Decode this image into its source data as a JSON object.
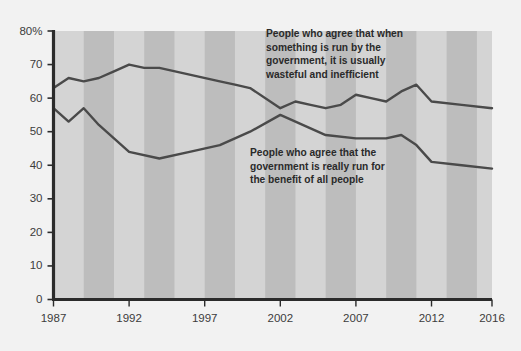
{
  "chart_data": {
    "type": "line",
    "title": "",
    "subtitle": "",
    "xlabel": "",
    "ylabel": "",
    "xlim": [
      1987,
      2016
    ],
    "ylim": [
      0,
      80
    ],
    "grid": false,
    "legend_position": "inline-annotations",
    "background": {
      "plot_fill": "#d4d4d4",
      "stripe_fill": "#bdbdbd",
      "page_fill": "#f2f2f2",
      "axis_color": "#2b2b2b",
      "line_color": "#4a4a4a"
    },
    "y_ticks": [
      "0",
      "10",
      "20",
      "30",
      "40",
      "50",
      "60",
      "70",
      "80%"
    ],
    "y_tick_values": [
      0,
      10,
      20,
      30,
      40,
      50,
      60,
      70,
      80
    ],
    "x_ticks": [
      "1987",
      "1992",
      "1997",
      "2002",
      "2007",
      "2012",
      "2016"
    ],
    "x_tick_values": [
      1987,
      1992,
      1997,
      2002,
      2007,
      2012,
      2016
    ],
    "series": [
      {
        "name": "People who agree that when something is run by the government, it is usually wasteful and inefficient",
        "color": "#4a4a4a",
        "x": [
          1987,
          1988,
          1989,
          1990,
          1991,
          1992,
          1993,
          1994,
          1996,
          1998,
          1999,
          2000,
          2002,
          2003,
          2004,
          2005,
          2006,
          2007,
          2008,
          2009,
          2010,
          2011,
          2012,
          2014,
          2016
        ],
        "values": [
          63,
          66,
          65,
          66,
          68,
          70,
          69,
          69,
          67,
          65,
          64,
          63,
          57,
          59,
          58,
          57,
          58,
          61,
          60,
          59,
          62,
          64,
          59,
          58,
          57
        ]
      },
      {
        "name": "People who agree that the government is really run for the benefit of all people",
        "color": "#4a4a4a",
        "x": [
          1987,
          1988,
          1989,
          1990,
          1992,
          1994,
          1996,
          1998,
          1999,
          2000,
          2002,
          2003,
          2004,
          2005,
          2007,
          2008,
          2009,
          2010,
          2011,
          2012,
          2014,
          2016
        ],
        "values": [
          57,
          53,
          57,
          52,
          44,
          42,
          44,
          46,
          48,
          50,
          55,
          53,
          51,
          49,
          48,
          48,
          48,
          49,
          46,
          41,
          40,
          39
        ]
      }
    ],
    "annotations": [
      {
        "id": "annotation-wasteful",
        "lines": [
          "People who agree that when",
          "something is run by the",
          "government, it is usually",
          "wasteful and inefficient"
        ],
        "x": 266,
        "y": 37
      },
      {
        "id": "annotation-benefit",
        "lines": [
          "People who agree that the",
          "government is really run for",
          "the benefit of all people"
        ],
        "x": 250,
        "y": 156
      }
    ]
  }
}
